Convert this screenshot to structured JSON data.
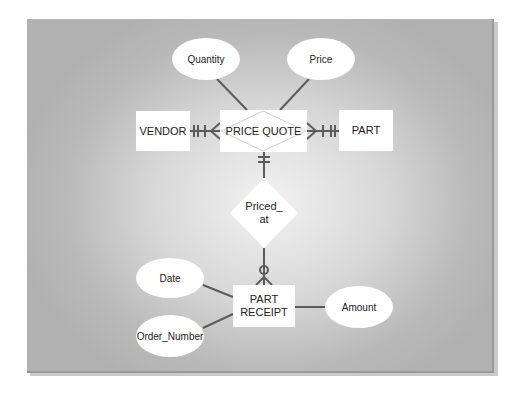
{
  "diagram": {
    "type": "entity-relationship",
    "colors": {
      "panel_edge": "#b4b4b4",
      "panel_center": "#f2f2f2",
      "shape_fill": "#ffffff",
      "line": "#606060",
      "diamond_outline": "#c8c8c8"
    },
    "entities": [
      {
        "id": "vendor",
        "label": "VENDOR"
      },
      {
        "id": "price_quote",
        "label": "PRICE QUOTE",
        "kind": "associative-entity"
      },
      {
        "id": "part",
        "label": "PART"
      },
      {
        "id": "part_receipt",
        "label": "PART RECEIPT",
        "label_lines": [
          "PART",
          "RECEIPT"
        ]
      }
    ],
    "relationships": [
      {
        "id": "priced_at",
        "label": "Priced_ at",
        "label_lines": [
          "Priced_",
          "at"
        ]
      }
    ],
    "attributes": [
      {
        "id": "quantity",
        "label": "Quantity",
        "of": "price_quote"
      },
      {
        "id": "price",
        "label": "Price",
        "of": "price_quote"
      },
      {
        "id": "date",
        "label": "Date",
        "of": "part_receipt"
      },
      {
        "id": "order_number",
        "label": "Order_Number",
        "of": "part_receipt"
      },
      {
        "id": "amount",
        "label": "Amount",
        "of": "part_receipt"
      }
    ],
    "connections": [
      {
        "from": "vendor",
        "to": "price_quote",
        "from_end": "mandatory-one",
        "to_end": "many"
      },
      {
        "from": "part",
        "to": "price_quote",
        "from_end": "mandatory-one",
        "to_end": "many"
      },
      {
        "from": "price_quote",
        "to": "priced_at",
        "from_end": "mandatory-one"
      },
      {
        "from": "priced_at",
        "to": "part_receipt",
        "to_end": "optional-many"
      }
    ]
  }
}
